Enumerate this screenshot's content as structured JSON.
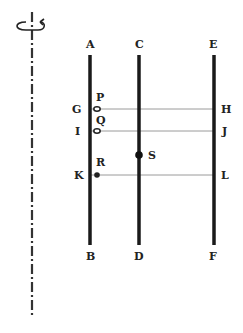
{
  "diagram": {
    "rotation_axis": {
      "label": "rotation-axis",
      "x": 32,
      "y_top": 12,
      "y_bottom": 318,
      "color": "#333333"
    },
    "rods": [
      {
        "id": "AB",
        "top_label": "A",
        "bottom_label": "B",
        "x": 90,
        "y_top": 55,
        "y_bottom": 245
      },
      {
        "id": "CD",
        "top_label": "C",
        "bottom_label": "D",
        "x": 139,
        "y_top": 55,
        "y_bottom": 245
      },
      {
        "id": "EF",
        "top_label": "E",
        "bottom_label": "F",
        "x": 214,
        "y_top": 55,
        "y_bottom": 245
      }
    ],
    "strings": [
      {
        "id": "GH",
        "left_label": "G",
        "right_label": "H",
        "y": 109
      },
      {
        "id": "IJ",
        "left_label": "I",
        "right_label": "J",
        "y": 131
      },
      {
        "id": "KL",
        "left_label": "K",
        "right_label": "L",
        "y": 175
      }
    ],
    "beads": [
      {
        "label": "P",
        "x": 97,
        "y": 109,
        "type": "ring"
      },
      {
        "label": "Q",
        "x": 97,
        "y": 131,
        "type": "ring"
      },
      {
        "label": "R",
        "x": 97,
        "y": 175,
        "type": "solid"
      },
      {
        "label": "S",
        "x": 139,
        "y": 155,
        "type": "solid-large"
      }
    ],
    "colors": {
      "rod": "#1a1a1a",
      "string": "#9a9a9a",
      "label": "#222222"
    }
  }
}
